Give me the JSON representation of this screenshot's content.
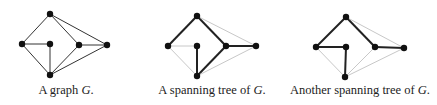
{
  "panels": [
    {
      "id": "graph",
      "caption_prefix": "A graph ",
      "caption_var": "G",
      "caption_suffix": ".",
      "caption_x": 66,
      "nodes": {
        "top": [
          50,
          14
        ],
        "left": [
          22,
          44
        ],
        "center": [
          50,
          44
        ],
        "right_inner": [
          79,
          45
        ],
        "far_right": [
          107,
          45
        ],
        "bottom": [
          50,
          75
        ]
      },
      "tree_edges": [],
      "non_tree_edges": []
    },
    {
      "id": "spanning-tree-1",
      "caption_prefix": "A spanning tree of ",
      "caption_var": "G",
      "caption_suffix": ".",
      "caption_x": 212,
      "nodes": {
        "top": [
          197,
          16
        ],
        "left": [
          168,
          46
        ],
        "center": [
          197,
          46
        ],
        "right_inner": [
          226,
          46
        ],
        "far_right": [
          256,
          46
        ],
        "bottom": [
          197,
          76
        ]
      }
    },
    {
      "id": "spanning-tree-2",
      "caption_prefix": "Another spanning tree of ",
      "caption_var": "G",
      "caption_suffix": ".",
      "caption_x": 360,
      "nodes": {
        "top": [
          346,
          17
        ],
        "left": [
          316,
          47
        ],
        "center": [
          346,
          47
        ],
        "right_inner": [
          375,
          47
        ],
        "far_right": [
          404,
          48
        ],
        "bottom": [
          345,
          77
        ]
      }
    }
  ],
  "graph_edges": [
    [
      "top",
      "left"
    ],
    [
      "top",
      "right_inner"
    ],
    [
      "top",
      "far_right"
    ],
    [
      "left",
      "center"
    ],
    [
      "left",
      "bottom"
    ],
    [
      "center",
      "bottom"
    ],
    [
      "right_inner",
      "far_right"
    ],
    [
      "right_inner",
      "bottom"
    ],
    [
      "far_right",
      "bottom"
    ]
  ],
  "tree1_edges": [
    [
      "top",
      "left"
    ],
    [
      "top",
      "right_inner"
    ],
    [
      "right_inner",
      "far_right"
    ],
    [
      "right_inner",
      "bottom"
    ],
    [
      "center",
      "bottom"
    ]
  ],
  "tree2_edges": [
    [
      "top",
      "left"
    ],
    [
      "left",
      "center"
    ],
    [
      "center",
      "bottom"
    ],
    [
      "top",
      "right_inner"
    ],
    [
      "right_inner",
      "far_right"
    ]
  ],
  "colors": {
    "graph_edge": "#333333",
    "tree_edge": "#222222",
    "non_tree_edge": "#c8c8c8",
    "node": "#111111"
  }
}
